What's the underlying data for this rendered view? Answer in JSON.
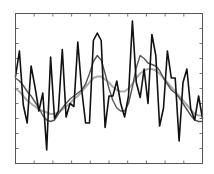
{
  "chart_data": {
    "type": "line",
    "title": "",
    "xlabel": "",
    "ylabel": "",
    "xlim": [
      0,
      48
    ],
    "ylim": [
      0,
      10
    ],
    "grid": false,
    "legend": "none",
    "x_ticks_count": 10,
    "y_ticks_count": 10,
    "x": [
      0,
      1,
      2,
      3,
      4,
      5,
      6,
      7,
      8,
      9,
      10,
      11,
      12,
      13,
      14,
      15,
      16,
      17,
      18,
      19,
      20,
      21,
      22,
      23,
      24,
      25,
      26,
      27,
      28,
      29,
      30,
      31,
      32,
      33,
      34,
      35,
      36,
      37,
      38,
      39,
      40,
      41,
      42,
      43,
      44,
      45,
      46,
      47,
      48
    ],
    "series": [
      {
        "name": "raw signal",
        "color": "#111111",
        "values": [
          5.8,
          7.5,
          3.9,
          2.7,
          6.5,
          5.1,
          3.5,
          4.7,
          0.9,
          7.1,
          3.0,
          3.5,
          7.6,
          3.1,
          4.0,
          3.8,
          8.1,
          4.9,
          2.7,
          2.7,
          8.2,
          8.7,
          8.2,
          2.4,
          4.5,
          4.5,
          5.5,
          4.0,
          3.1,
          4.5,
          9.5,
          5.4,
          4.4,
          6.3,
          4.0,
          8.6,
          7.2,
          2.5,
          3.7,
          7.5,
          5.7,
          5.7,
          1.5,
          5.4,
          6.3,
          3.6,
          2.9,
          4.5,
          3.0
        ]
      },
      {
        "name": "moderate smoothing",
        "color": "#555555",
        "values": [
          5.7,
          5.5,
          5.2,
          4.8,
          4.5,
          4.1,
          3.7,
          3.2,
          2.9,
          2.8,
          2.9,
          3.3,
          3.7,
          4.0,
          4.3,
          4.5,
          4.7,
          4.9,
          5.3,
          6.0,
          6.8,
          7.2,
          6.9,
          6.0,
          5.0,
          4.2,
          3.7,
          3.5,
          3.5,
          4.0,
          5.1,
          6.4,
          7.2,
          7.0,
          6.7,
          6.6,
          6.5,
          6.2,
          5.7,
          5.3,
          4.9,
          4.7,
          4.4,
          4.0,
          3.6,
          3.2,
          2.9,
          2.8,
          2.8
        ]
      },
      {
        "name": "heavy smoothing",
        "color": "#aaaaaa",
        "values": [
          5.0,
          4.8,
          4.5,
          4.2,
          4.0,
          3.8,
          3.6,
          3.5,
          3.4,
          3.3,
          3.3,
          3.4,
          3.6,
          3.8,
          4.0,
          4.3,
          4.5,
          4.8,
          5.1,
          5.4,
          5.7,
          5.8,
          5.8,
          5.6,
          5.4,
          5.1,
          4.9,
          4.8,
          4.8,
          5.0,
          5.3,
          5.7,
          6.0,
          6.2,
          6.3,
          6.3,
          6.2,
          6.0,
          5.7,
          5.4,
          5.1,
          4.8,
          4.5,
          4.2,
          3.9,
          3.6,
          3.3,
          3.2,
          3.2
        ]
      }
    ]
  }
}
